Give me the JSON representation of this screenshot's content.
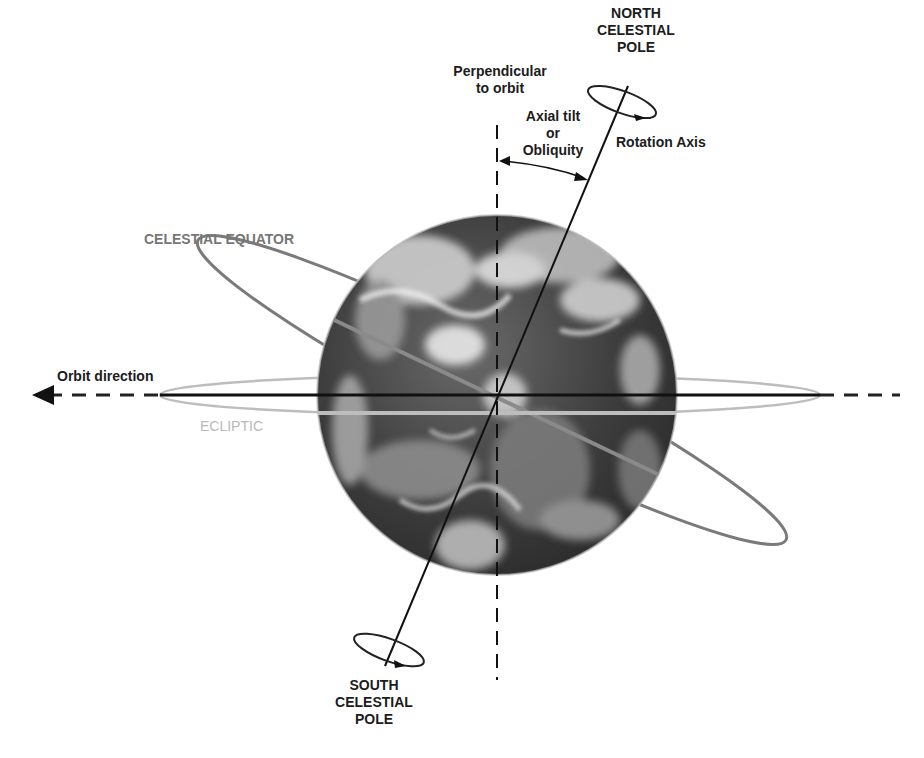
{
  "diagram": {
    "labels": {
      "north_pole": [
        "NORTH",
        "CELESTIAL",
        "POLE"
      ],
      "south_pole": [
        "SOUTH",
        "CELESTIAL",
        "POLE"
      ],
      "perpendicular": [
        "Perpendicular",
        "to orbit"
      ],
      "axial_tilt": [
        "Axial tilt",
        "or",
        "Obliquity"
      ],
      "rotation_axis": "Rotation Axis",
      "celestial_equator": "CELESTIAL EQUATOR",
      "orbit_direction": "Orbit direction",
      "ecliptic": "ECLIPTIC"
    },
    "colors": {
      "background": "#ffffff",
      "line": "#111111",
      "celestial_equator": "#7a7a7a",
      "ecliptic": "#bdbdbd",
      "earth_dark": "#3a3a3a",
      "earth_light": "#d8d8d8"
    },
    "icons": {
      "orbit_arrow": "arrow-left-icon",
      "rotation_north": "rotation-ellipse-icon",
      "rotation_south": "rotation-ellipse-icon"
    }
  }
}
